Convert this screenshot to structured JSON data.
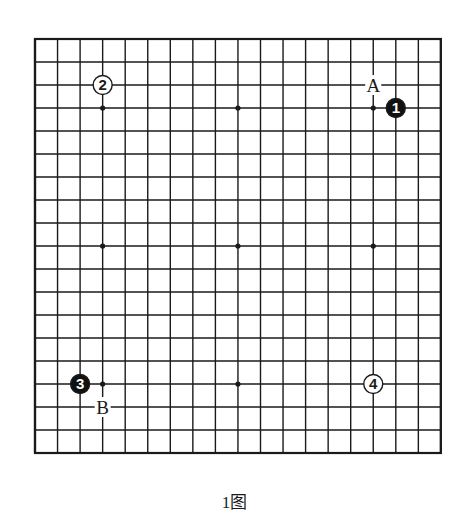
{
  "figure": {
    "caption": "1图"
  },
  "board": {
    "size": 19,
    "origin_x": 35,
    "origin_y": 39,
    "step_x": 22.55,
    "step_y": 23.0,
    "line_color": "#1a1a1a",
    "border_width": 2.2,
    "line_width": 1.4,
    "star_points": [
      [
        3,
        3
      ],
      [
        9,
        3
      ],
      [
        15,
        3
      ],
      [
        3,
        9
      ],
      [
        9,
        9
      ],
      [
        15,
        9
      ],
      [
        3,
        15
      ],
      [
        9,
        15
      ],
      [
        15,
        15
      ]
    ]
  },
  "stones": [
    {
      "move": "1",
      "color": "black",
      "col": 16,
      "row": 3
    },
    {
      "move": "2",
      "color": "white",
      "col": 3,
      "row": 2
    },
    {
      "move": "3",
      "color": "black",
      "col": 2,
      "row": 15
    },
    {
      "move": "4",
      "color": "white",
      "col": 15,
      "row": 15
    }
  ],
  "labels": [
    {
      "text": "A",
      "col": 15,
      "row": 2
    },
    {
      "text": "B",
      "col": 3,
      "row": 16
    }
  ],
  "colors": {
    "black_stone": "#111111",
    "white_stone": "#ffffff",
    "ink": "#1a1a1a",
    "background": "#ffffff"
  }
}
